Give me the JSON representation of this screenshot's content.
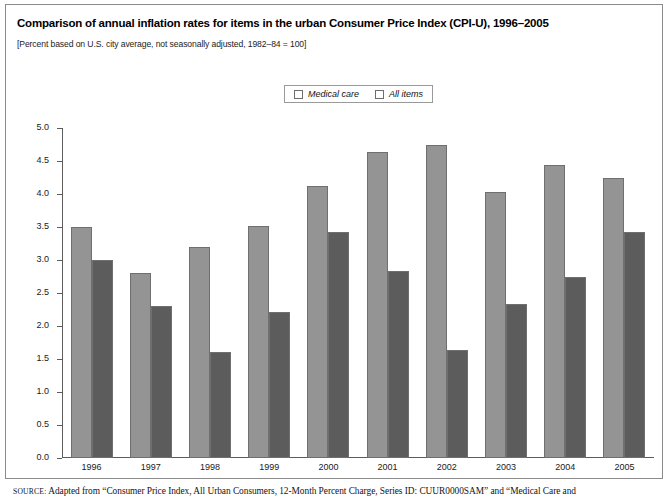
{
  "figure": {
    "title": "Comparison of annual inflation rates for items in the urban Consumer Price Index (CPI-U), 1996–2005",
    "subtitle": "[Percent based on U.S. city average, not seasonally adjusted, 1982–84 = 100]",
    "source_keyword": "SOURCE:",
    "source_text": "Adapted from “Consumer Price Index, All Urban Consumers, 12-Month Percent Charge, Series ID: CUUR0000SAM” and “Medical Care and"
  },
  "colors": {
    "medical_care": "#949494",
    "all_items": "#5c5c5c",
    "axis": "#5c5c5c",
    "frame": "#8a8a8a"
  },
  "chart_data": {
    "type": "bar",
    "title": "Comparison of annual inflation rates for items in the urban Consumer Price Index (CPI-U), 1996–2005",
    "subtitle": "[Percent based on U.S. city average, not seasonally adjusted, 1982–84 = 100]",
    "xlabel": "",
    "ylabel": "",
    "ylim": [
      0.0,
      5.0
    ],
    "ytick_labels": [
      "5.0",
      "4.5",
      "4.0",
      "3.5",
      "3.0",
      "2.5",
      "2.0",
      "1.5",
      "1.0",
      "0.5",
      "0.0"
    ],
    "ytick_values": [
      5.0,
      4.5,
      4.0,
      3.5,
      3.0,
      2.5,
      2.0,
      1.5,
      1.0,
      0.5,
      0.0
    ],
    "grid": false,
    "legend_position": "top-center",
    "categories": [
      "1996",
      "1997",
      "1998",
      "1999",
      "2000",
      "2001",
      "2002",
      "2003",
      "2004",
      "2005"
    ],
    "series": [
      {
        "name": "Medical care",
        "color": "#949494",
        "values": [
          3.5,
          2.8,
          3.2,
          3.52,
          4.12,
          4.63,
          4.74,
          4.03,
          4.44,
          4.24
        ]
      },
      {
        "name": "All items",
        "color": "#5c5c5c",
        "values": [
          3.0,
          2.3,
          1.61,
          2.21,
          3.42,
          2.83,
          1.64,
          2.34,
          2.74,
          3.43
        ]
      }
    ]
  }
}
